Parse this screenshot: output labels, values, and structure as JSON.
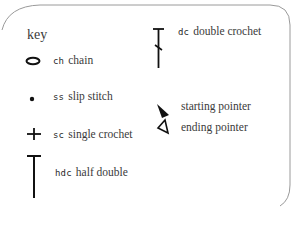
{
  "legend": {
    "title": "key",
    "items": [
      {
        "symbol": "oval",
        "abbr": "ch",
        "description": "chain"
      },
      {
        "symbol": "dot",
        "abbr": "ss",
        "description": "slip stitch"
      },
      {
        "symbol": "plus",
        "abbr": "sc",
        "description": "single crochet"
      },
      {
        "symbol": "tall-t",
        "abbr": "hdc",
        "description": "half double"
      },
      {
        "symbol": "t-with-slash",
        "abbr": "dc",
        "description": "double crochet"
      },
      {
        "symbol": "filled-triangle",
        "abbr": "",
        "description": "starting pointer"
      },
      {
        "symbol": "outline-triangle",
        "abbr": "",
        "description": "ending pointer"
      }
    ]
  },
  "colors": {
    "border": "#9a9a9a",
    "symbol": "#111111",
    "text": "#3a3a3a"
  }
}
